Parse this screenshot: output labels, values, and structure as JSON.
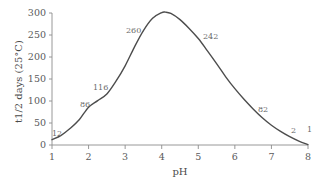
{
  "chart_data": {
    "type": "line",
    "title": "",
    "subtitle": "",
    "xlabel": "pH",
    "ylabel": "t1/2 days (25°C)",
    "xlim": [
      1,
      8
    ],
    "ylim": [
      0,
      300
    ],
    "grid": false,
    "legend": false,
    "x_ticks": [
      1,
      2,
      3,
      4,
      5,
      6,
      7,
      8
    ],
    "x_tick_labels": [
      "1",
      "2",
      "3",
      "4",
      "5",
      "6",
      "7",
      "8"
    ],
    "y_ticks": [
      0,
      50,
      100,
      150,
      200,
      250,
      300
    ],
    "y_tick_labels": [
      "0",
      "50",
      "100",
      "150",
      "200",
      "250",
      "300"
    ],
    "series": [
      {
        "name": "half-life",
        "x": [
          1.0,
          1.25,
          1.5,
          1.75,
          2.0,
          2.25,
          2.5,
          2.75,
          3.0,
          3.25,
          3.5,
          3.75,
          4.0,
          4.1,
          4.25,
          4.5,
          4.75,
          5.0,
          5.25,
          5.5,
          5.75,
          6.0,
          6.25,
          6.5,
          6.75,
          7.0,
          7.25,
          7.5,
          7.75,
          8.0
        ],
        "y": [
          12,
          22,
          38,
          58,
          86,
          101,
          116,
          145,
          180,
          222,
          260,
          288,
          301,
          302,
          299,
          285,
          265,
          242,
          214,
          185,
          155,
          128,
          104,
          82,
          62,
          45,
          31,
          19,
          9,
          1
        ]
      }
    ],
    "annotations": [
      {
        "label": "12",
        "x": 1.0,
        "y": 12,
        "px": 52,
        "py": 130
      },
      {
        "label": "86",
        "x": 2.0,
        "y": 86,
        "px": 80,
        "py": 101
      },
      {
        "label": "116",
        "x": 2.5,
        "y": 116,
        "px": 93,
        "py": 84
      },
      {
        "label": "260",
        "x": 3.5,
        "y": 260,
        "px": 126,
        "py": 27
      },
      {
        "label": "242",
        "x": 5.0,
        "y": 242,
        "px": 203,
        "py": 33
      },
      {
        "label": "82",
        "x": 6.5,
        "y": 82,
        "px": 258,
        "py": 106
      },
      {
        "label": "2",
        "x": 7.75,
        "y": 2,
        "px": 291,
        "py": 127
      },
      {
        "label": "1",
        "x": 8.0,
        "y": 1,
        "px": 307,
        "py": 126
      }
    ],
    "colors": {
      "curve": "#4d4d4d",
      "axis": "#8c8c8c",
      "tick_text": "#5a5a5a",
      "label_text": "#6a6a6a",
      "background": "#ffffff"
    }
  }
}
